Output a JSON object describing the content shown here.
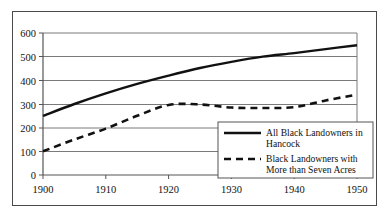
{
  "chart_data": {
    "type": "line",
    "title": "",
    "subtitle": "",
    "xlabel": "",
    "ylabel": "",
    "xlim": [
      1900,
      1950
    ],
    "ylim": [
      0,
      600
    ],
    "grid": "horizontal",
    "legend_position": "bottom-right",
    "x_ticks": [
      "1900",
      "1910",
      "1920",
      "1930",
      "1940",
      "1950"
    ],
    "y_ticks": [
      "0",
      "100",
      "200",
      "300",
      "400",
      "500",
      "600"
    ],
    "x": [
      1900,
      1905,
      1910,
      1915,
      1920,
      1925,
      1930,
      1935,
      1940,
      1945,
      1950
    ],
    "series": [
      {
        "name": "All Black Landowners in Hancock",
        "style": "solid",
        "color": "#111111",
        "values": [
          250,
          300,
          345,
          385,
          420,
          452,
          478,
          500,
          515,
          532,
          548
        ]
      },
      {
        "name": "Black Landowners with More than Seven Acres",
        "style": "dashed",
        "color": "#111111",
        "values": [
          100,
          150,
          196,
          250,
          296,
          298,
          285,
          283,
          287,
          315,
          340
        ]
      }
    ]
  },
  "axes": {
    "y_tick_labels": [
      "600",
      "500",
      "400",
      "300",
      "200",
      "100",
      "0"
    ],
    "x_tick_labels": [
      "1900",
      "1910",
      "1920",
      "1930",
      "1940",
      "1950"
    ]
  },
  "legend": {
    "entries": [
      {
        "line1": "All Black Landowners in",
        "line2": "Hancock",
        "style": "solid"
      },
      {
        "line1": "Black Landowners with",
        "line2": "More than Seven Acres",
        "style": "dashed"
      }
    ]
  },
  "colors": {
    "line": "#111111",
    "grid": "#7a7a7a",
    "axis": "#555555",
    "outer_border": "#4a4a4a",
    "legend_border": "#555555",
    "background": "#ffffff"
  }
}
